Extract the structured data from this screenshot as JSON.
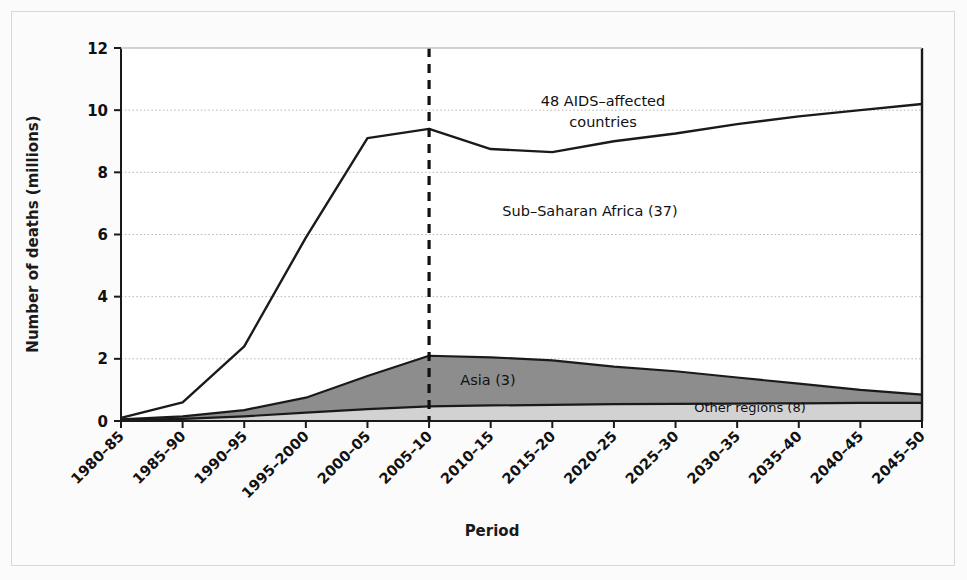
{
  "chart_data": {
    "type": "area",
    "title": "",
    "xlabel": "Period",
    "ylabel": "Number of deaths (millions)",
    "ylim": [
      0,
      12
    ],
    "yticks": [
      0,
      2,
      4,
      6,
      8,
      10,
      12
    ],
    "grid": true,
    "legend_position": "inline-annotations",
    "categories": [
      "1980–85",
      "1985–90",
      "1990–95",
      "1995–2000",
      "2000–05",
      "2005–10",
      "2010–15",
      "2015–20",
      "2020–25",
      "2025–30",
      "2030–35",
      "2035–40",
      "2040–45",
      "2045–50"
    ],
    "series": [
      {
        "name": "48 AIDS-affected countries",
        "kind": "total-line",
        "values": [
          0.1,
          0.6,
          2.4,
          5.9,
          9.1,
          9.4,
          8.75,
          8.65,
          9.0,
          9.25,
          9.55,
          9.8,
          10.0,
          10.2
        ]
      },
      {
        "name": "Asia (3)",
        "kind": "stacked-area-upper",
        "values": [
          0.05,
          0.15,
          0.35,
          0.75,
          1.45,
          2.1,
          2.05,
          1.95,
          1.75,
          1.6,
          1.4,
          1.2,
          1.0,
          0.85
        ]
      },
      {
        "name": "Other regions (8)",
        "kind": "stacked-area-lower",
        "values": [
          0.03,
          0.07,
          0.15,
          0.27,
          0.38,
          0.47,
          0.5,
          0.52,
          0.54,
          0.55,
          0.56,
          0.57,
          0.58,
          0.58
        ]
      }
    ],
    "annotations": [
      {
        "name": "total-label",
        "text_line1": "48 AIDS–affected",
        "text_line2": "countries",
        "x": 603,
        "y": 106
      },
      {
        "name": "sub-saharan-label",
        "text": "Sub–Saharan Africa (37)",
        "x": 590,
        "y": 216
      },
      {
        "name": "asia-label",
        "text": "Asia (3)",
        "x": 488,
        "y": 385
      },
      {
        "name": "other-regions-label",
        "text": "Other regions (8)",
        "x": 750,
        "y": 410
      }
    ],
    "reference_line": {
      "name": "projection-divider",
      "label": "",
      "at_category": "2005–10",
      "style": "dashed"
    },
    "colors": {
      "asia_fill": "#8d8d8d",
      "other_fill": "#d2d2d2",
      "line": "#1a1a1a",
      "grid": "#b9b9b9",
      "background": "#fbfbfb",
      "axis": "#1a1a1a"
    }
  }
}
